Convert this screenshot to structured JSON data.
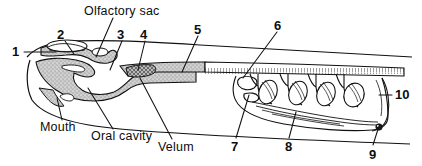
{
  "figure": {
    "background_color": "#ffffff",
    "ink_color": "#111111",
    "tissue_fill_color": "#c9c9c9",
    "velum_hatch_color": "#7a7a7a",
    "width": 422,
    "height": 166
  },
  "labels": {
    "numbered": [
      {
        "id": "1",
        "text": "1",
        "x": 14,
        "y": 47,
        "leader": {
          "x1": 24,
          "y1": 52,
          "x2": 56,
          "y2": 52
        }
      },
      {
        "id": "2",
        "text": "2",
        "x": 59,
        "y": 32,
        "leader": {
          "x1": 65,
          "y1": 41,
          "x2": 74,
          "y2": 54
        }
      },
      {
        "id": "3",
        "text": "3",
        "x": 119,
        "y": 32,
        "leader": {
          "x1": 122,
          "y1": 41,
          "x2": 110,
          "y2": 70
        }
      },
      {
        "id": "4",
        "text": "4",
        "x": 142,
        "y": 32,
        "leader": {
          "x1": 145,
          "y1": 41,
          "x2": 138,
          "y2": 70
        }
      },
      {
        "id": "5",
        "text": "5",
        "x": 196,
        "y": 26,
        "leader": {
          "x1": 198,
          "y1": 36,
          "x2": 182,
          "y2": 72
        }
      },
      {
        "id": "6",
        "text": "6",
        "x": 278,
        "y": 22,
        "leader": {
          "x1": 277,
          "y1": 32,
          "x2": 243,
          "y2": 78
        }
      },
      {
        "id": "7",
        "text": "7",
        "x": 233,
        "y": 144,
        "leader": {
          "x1": 236,
          "y1": 138,
          "x2": 249,
          "y2": 95
        }
      },
      {
        "id": "8",
        "text": "8",
        "x": 287,
        "y": 144,
        "leader": {
          "x1": 289,
          "y1": 138,
          "x2": 296,
          "y2": 112
        }
      },
      {
        "id": "9",
        "text": "9",
        "x": 371,
        "y": 152,
        "leader": {
          "x1": 373,
          "y1": 145,
          "x2": 379,
          "y2": 125
        }
      },
      {
        "id": "10",
        "text": "10",
        "x": 394,
        "y": 92,
        "leader": {
          "x1": 392,
          "y1": 95,
          "x2": 380,
          "y2": 95
        }
      }
    ],
    "named": [
      {
        "id": "olfactory-sac",
        "text": "Olfactory sac",
        "x": 84,
        "y": 6,
        "leader": {
          "x1": 113,
          "y1": 18,
          "x2": 96,
          "y2": 57
        }
      },
      {
        "id": "mouth",
        "text": "Mouth",
        "x": 42,
        "y": 123,
        "leader": {
          "x1": 62,
          "y1": 120,
          "x2": 57,
          "y2": 98
        }
      },
      {
        "id": "oral-cavity",
        "text": "Oral cavity",
        "x": 93,
        "y": 132,
        "leader": {
          "x1": 113,
          "y1": 129,
          "x2": 88,
          "y2": 88
        }
      },
      {
        "id": "velum",
        "text": "Velum",
        "x": 160,
        "y": 143,
        "leader": {
          "x1": 172,
          "y1": 139,
          "x2": 140,
          "y2": 78
        }
      }
    ]
  }
}
